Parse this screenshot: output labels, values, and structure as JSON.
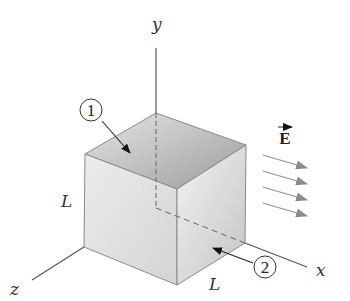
{
  "diagram": {
    "title": "",
    "axes": {
      "x_label": "x",
      "y_label": "y",
      "z_label": "z"
    },
    "dimensions": {
      "side_label_left": "L",
      "side_label_bottom": "L"
    },
    "face_markers": [
      {
        "id": "1",
        "label": "1",
        "face": "top"
      },
      {
        "id": "2",
        "label": "2",
        "face": "right (x = L)"
      }
    ],
    "field": {
      "label": "E",
      "vector": true,
      "arrow_count": 4,
      "direction": "+x"
    },
    "colors": {
      "top_face": "#a8a8a8",
      "front_face": "#e4e4e4",
      "right_face": "#d6d6d6",
      "edge": "#8a8a8a",
      "axis": "#555555",
      "field_arrow": "#909090"
    }
  }
}
